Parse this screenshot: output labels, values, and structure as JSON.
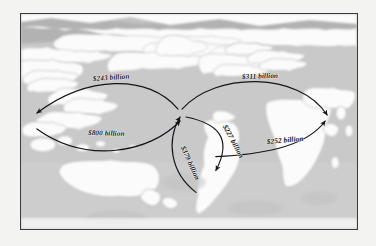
{
  "figure": {
    "type": "world-map-flow-diagram",
    "frame_border_color": "#3a3a3c",
    "ocean_color": "#c9c9c9",
    "land_color": "#fbfbfb",
    "coast_shade_color": "#b2b2b2",
    "page_background": "#f3f3f2",
    "arrow_color": "#14141a"
  },
  "flows": [
    {
      "id": "asia-to-north-america",
      "label": "$243 billion",
      "amount": 243,
      "currency": "USD",
      "unit": "billion",
      "origin": "Europe/Asia hub",
      "destination": "East Asia / Pacific",
      "direction": "westward-upper"
    },
    {
      "id": "north-america-to-asia",
      "label": "$800 billion",
      "amount": 800,
      "currency": "USD",
      "unit": "billion",
      "origin": "East Asia / Pacific",
      "destination": "Europe hub",
      "direction": "eastward-lower"
    },
    {
      "id": "europe-to-north-america",
      "label": "$311 billion",
      "amount": 311,
      "currency": "USD",
      "unit": "billion",
      "origin": "Europe hub",
      "destination": "Middle East / Asia",
      "direction": "eastward-upper"
    },
    {
      "id": "africa-to-europe",
      "label": "$252 billion",
      "amount": 252,
      "currency": "USD",
      "unit": "billion",
      "origin": "South America",
      "destination": "Middle East / Africa",
      "direction": "eastward-lower"
    },
    {
      "id": "south-america-inbound",
      "label": "$227 billion",
      "amount": 227,
      "currency": "USD",
      "unit": "billion",
      "origin": "Europe hub",
      "destination": "South America",
      "direction": "southward"
    },
    {
      "id": "south-america-outbound",
      "label": "$379 billion",
      "amount": 379,
      "currency": "USD",
      "unit": "billion",
      "origin": "South America",
      "destination": "Europe hub",
      "direction": "northward"
    }
  ]
}
